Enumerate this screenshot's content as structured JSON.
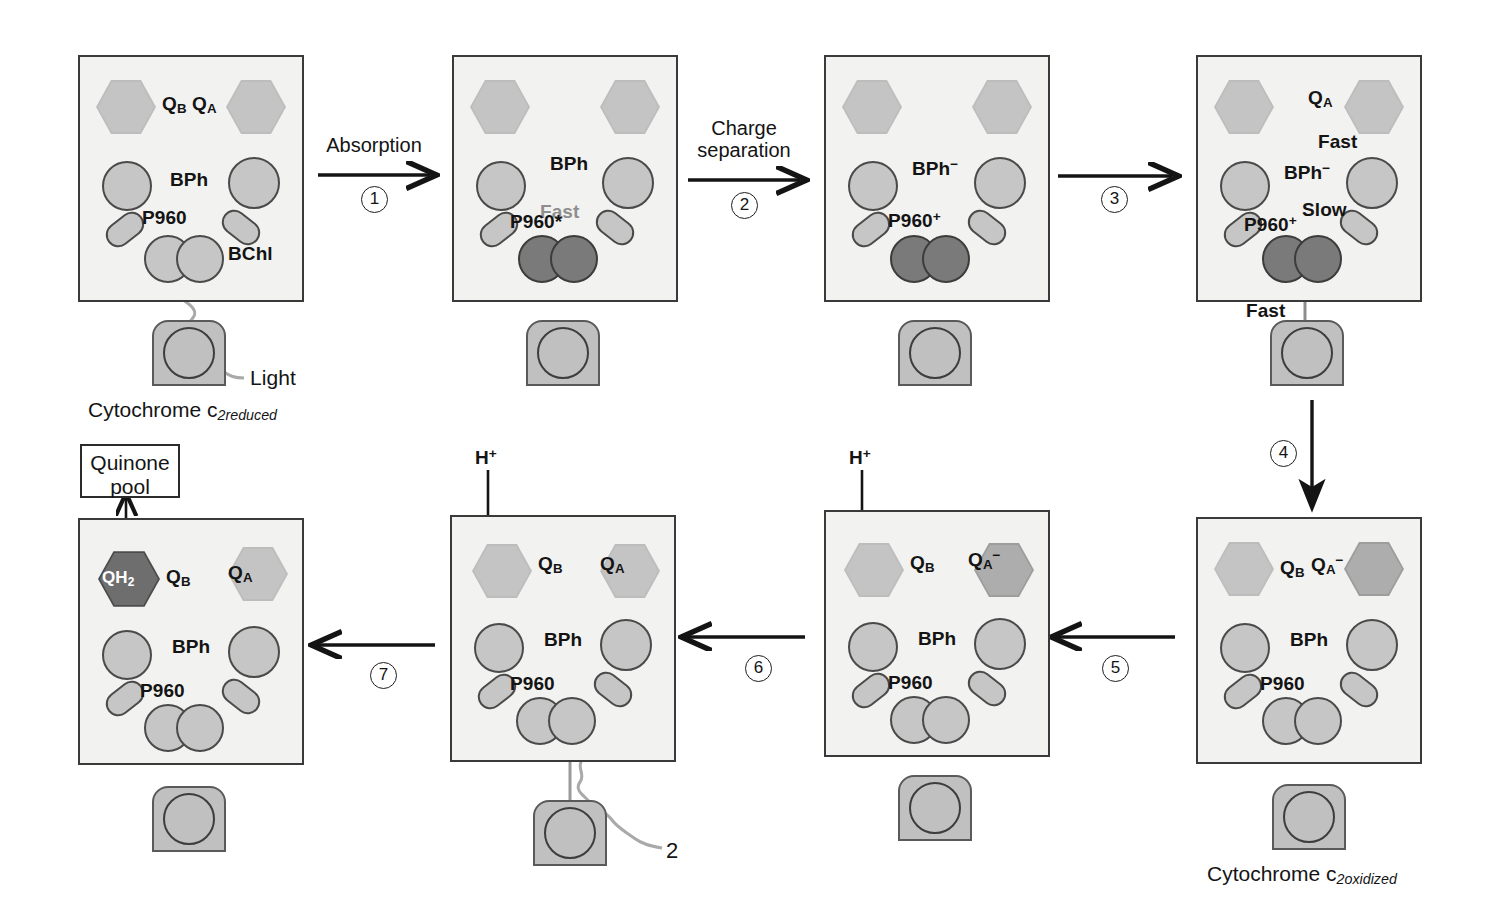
{
  "figure": {
    "colors": {
      "panel_fill": "#f2f2f0",
      "panel_stroke": "#3a3a3a",
      "pigment_light": "#c6c6c6",
      "pigment_dark": "#7a7a7a",
      "quinone_light": "#bdbdbd",
      "quinone_mid": "#9d9d9d",
      "quinone_dark": "#4c4c4c",
      "cytochrome_fill": "#c0c0c0",
      "gray_text": "#8e8e8e",
      "arrow_gray": "#9a9a9a",
      "black": "#141414"
    }
  },
  "steps": [
    {
      "num": "1",
      "label_line1": "Absorption",
      "label_line2": ""
    },
    {
      "num": "2",
      "label_line1": "Charge",
      "label_line2": "separation"
    },
    {
      "num": "3",
      "label_line1": "",
      "label_line2": ""
    },
    {
      "num": "4",
      "label_line1": "",
      "label_line2": ""
    },
    {
      "num": "5",
      "label_line1": "",
      "label_line2": ""
    },
    {
      "num": "6",
      "label_line1": "",
      "label_line2": ""
    },
    {
      "num": "7",
      "label_line1": "",
      "label_line2": ""
    }
  ],
  "panels": [
    {
      "id": "panel-1",
      "labels": {
        "qb": "Q",
        "qb_sub": "B",
        "qa": "Q",
        "qa_sub": "A",
        "bph": "BPh",
        "p960": "P960",
        "bchl": "BChl"
      },
      "cytochrome": "Cytochrome c",
      "cytochrome_sub": "2reduced",
      "light": "Light"
    },
    {
      "id": "panel-2",
      "labels": {
        "bph": "BPh",
        "p960": "P960*",
        "rate": "Fast"
      }
    },
    {
      "id": "panel-3",
      "labels": {
        "bph": "BPh",
        "bph_sup": "−",
        "p960": "P960",
        "p960_sup": "+"
      }
    },
    {
      "id": "panel-4",
      "labels": {
        "qa": "Q",
        "qa_sub": "A",
        "bph": "BPh",
        "bph_sup": "−",
        "p960": "P960",
        "p960_sup": "+",
        "rate_top": "Fast",
        "rate_mid": "Slow",
        "rate_bottom": "Fast"
      }
    },
    {
      "id": "panel-5",
      "labels": {
        "qb": "Q",
        "qb_sub": "B",
        "qa": "Q",
        "qa_sub": "A",
        "qa_sup": "−",
        "bph": "BPh",
        "p960": "P960"
      },
      "cytochrome": "Cytochrome c",
      "cytochrome_sub": "2oxidized"
    },
    {
      "id": "panel-6",
      "labels": {
        "hplus": "H",
        "hplus_sup": "+",
        "qb": "Q",
        "qb_sub": "B",
        "qa": "Q",
        "qa_sub": "A",
        "qa_sup": "−",
        "bph": "BPh",
        "p960": "P960"
      }
    },
    {
      "id": "panel-7",
      "labels": {
        "hplus": "H",
        "hplus_sup": "+",
        "qb": "Q",
        "qb_sub": "B",
        "qa": "Q",
        "qa_sub": "A",
        "bph": "BPh",
        "p960": "P960",
        "light_count": "2"
      }
    },
    {
      "id": "panel-8",
      "labels": {
        "qh2": "QH",
        "qh2_sub": "2",
        "qb": "Q",
        "qb_sub": "B",
        "qa": "Q",
        "qa_sub": "A",
        "bph": "BPh",
        "p960": "P960"
      },
      "quinone_pool_line1": "Quinone",
      "quinone_pool_line2": "pool"
    }
  ]
}
